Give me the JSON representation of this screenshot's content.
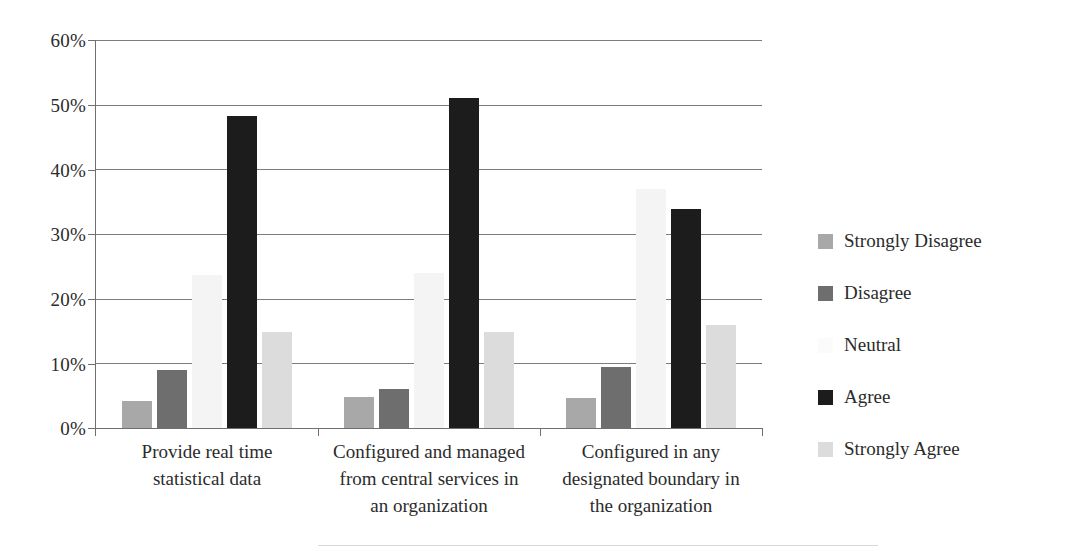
{
  "chart_data": {
    "type": "bar",
    "title": "",
    "subtitle": "",
    "xlabel": "",
    "ylabel": "",
    "ylim": [
      0,
      60
    ],
    "ytick_labels": [
      "0%",
      "10%",
      "20%",
      "30%",
      "40%",
      "50%",
      "60%"
    ],
    "ytick_values": [
      0,
      10,
      20,
      30,
      40,
      50,
      60
    ],
    "grid": true,
    "legend_position": "right",
    "categories": [
      "Provide real time statistical data",
      "Configured and managed from central services in an organization",
      "Configured in any designated boundary in the organization"
    ],
    "category_lines": [
      [
        "Provide real time",
        "statistical data"
      ],
      [
        "Configured and managed",
        "from central services in",
        "an organization"
      ],
      [
        "Configured in any",
        "designated boundary in",
        "the organization"
      ]
    ],
    "series": [
      {
        "name": "Strongly Disagree",
        "color": "#a8a8a8",
        "values": [
          4.2,
          4.8,
          4.7
        ]
      },
      {
        "name": "Disagree",
        "color": "#6e6e6e",
        "values": [
          9.0,
          6.0,
          9.5
        ]
      },
      {
        "name": "Neutral",
        "color": "#f4f4f4",
        "values": [
          23.7,
          24.0,
          37.0
        ]
      },
      {
        "name": "Agree",
        "color": "#1c1c1c",
        "values": [
          48.3,
          51.0,
          33.8
        ]
      },
      {
        "name": "Strongly Agree",
        "color": "#dcdcdc",
        "values": [
          14.8,
          14.8,
          16.0
        ]
      }
    ]
  },
  "axis": {
    "y_tick_0": "0%",
    "y_tick_1": "10%",
    "y_tick_2": "20%",
    "y_tick_3": "30%",
    "y_tick_4": "40%",
    "y_tick_5": "50%",
    "y_tick_6": "60%"
  },
  "legend": {
    "items": [
      {
        "label": "Strongly Disagree",
        "color": "#a8a8a8"
      },
      {
        "label": "Disagree",
        "color": "#6e6e6e"
      },
      {
        "label": "Neutral",
        "color": "#fbfbfb"
      },
      {
        "label": "Agree",
        "color": "#1c1c1c"
      },
      {
        "label": "Strongly Agree",
        "color": "#dcdcdc"
      }
    ]
  }
}
